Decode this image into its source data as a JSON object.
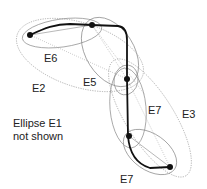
{
  "diagram": {
    "points": [
      {
        "id": "p1",
        "x": 30,
        "y": 35
      },
      {
        "id": "p2",
        "x": 92,
        "y": 25
      },
      {
        "id": "p3",
        "x": 127,
        "y": 79
      },
      {
        "id": "p4",
        "x": 129,
        "y": 136
      },
      {
        "id": "p5",
        "x": 170,
        "y": 167
      }
    ],
    "ellipses": [
      {
        "id": "E2",
        "label": "E2",
        "label_x": 30,
        "label_y": 92
      },
      {
        "id": "E3",
        "label": "E3",
        "label_x": 182,
        "label_y": 117
      },
      {
        "id": "E4",
        "label": "E4",
        "label_x": 44,
        "label_y": 62
      },
      {
        "id": "E5",
        "label": "E5",
        "label_x": 83,
        "label_y": 86
      },
      {
        "id": "E6",
        "label": "E6",
        "label_x": 148,
        "label_y": 113
      },
      {
        "id": "E7",
        "label": "E7",
        "label_x": 120,
        "label_y": 183
      }
    ],
    "note": {
      "line1": "Ellipse E1",
      "line2": "not shown"
    }
  }
}
